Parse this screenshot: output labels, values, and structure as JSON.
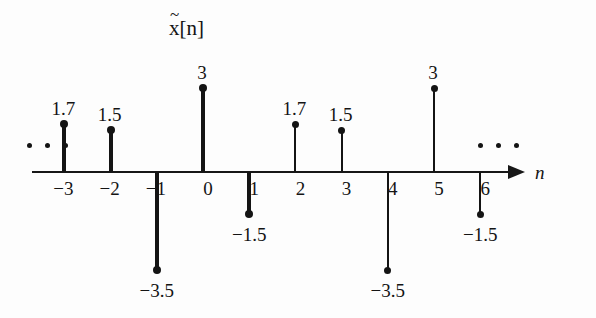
{
  "figure": {
    "title": "x[n]",
    "title_accent": "~",
    "axis_label": "n",
    "left_ellipsis": "...",
    "right_ellipsis": "...",
    "ink_color": "#141414",
    "background_color": "#fdfdfd"
  },
  "chart_data": {
    "type": "scatter",
    "xlabel": "n",
    "ylabel": "",
    "grid": false,
    "legend": null,
    "xlim": [
      -4,
      7
    ],
    "ylim": [
      -3.5,
      3
    ],
    "periodic": true,
    "period": 4,
    "x": [
      -3,
      -2,
      -1,
      0,
      1,
      2,
      3,
      4,
      5,
      6
    ],
    "values": [
      1.7,
      1.5,
      -3.5,
      3,
      -1.5,
      1.7,
      1.5,
      -3.5,
      3,
      -1.5
    ],
    "tick_labels": [
      "−3",
      "−2",
      "−1",
      "0",
      "1",
      "2",
      "3",
      "4",
      "5",
      "6"
    ],
    "point_labels": [
      "1.7",
      "1.5",
      "−3.5",
      "3",
      "−1.5",
      "1.7",
      "1.5",
      "−3.5",
      "3",
      "−1.5"
    ],
    "annotations": [
      "...",
      "..."
    ]
  },
  "samples": [
    {
      "n": "-3",
      "tick": "−3",
      "value": 1.7,
      "label": "1.7",
      "bold": true
    },
    {
      "n": "-2",
      "tick": "−2",
      "value": 1.5,
      "label": "1.5",
      "bold": true
    },
    {
      "n": "-1",
      "tick": "−1",
      "value": -3.5,
      "label": "−3.5",
      "bold": true
    },
    {
      "n": "0",
      "tick": "0",
      "value": 3,
      "label": "3",
      "bold": true
    },
    {
      "n": "1",
      "tick": "1",
      "value": -1.5,
      "label": "−1.5",
      "bold": true
    },
    {
      "n": "2",
      "tick": "2",
      "value": 1.7,
      "label": "1.7",
      "bold": false
    },
    {
      "n": "3",
      "tick": "3",
      "value": 1.5,
      "label": "1.5",
      "bold": false
    },
    {
      "n": "4",
      "tick": "4",
      "value": -3.5,
      "label": "−3.5",
      "bold": false
    },
    {
      "n": "5",
      "tick": "5",
      "value": 3,
      "label": "3",
      "bold": false
    },
    {
      "n": "6",
      "tick": "6",
      "value": -1.5,
      "label": "−1.5",
      "bold": false
    }
  ]
}
